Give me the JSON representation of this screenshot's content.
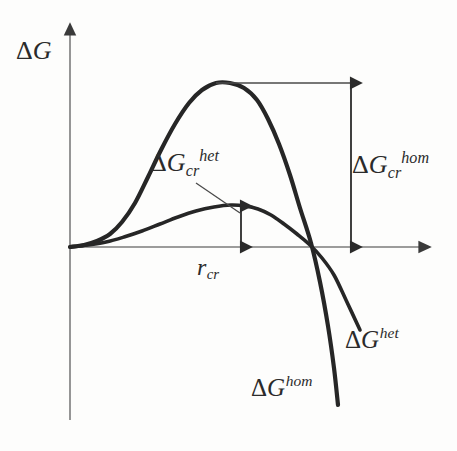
{
  "figure": {
    "background_color": "#fdfdfc",
    "ink_color": "#2b2b2b",
    "axis_color": "#6e6e6e",
    "curve_color": "#262626"
  },
  "axes": {
    "y_label": "ΔG",
    "x_label": "",
    "origin": {
      "x": 70,
      "y": 247
    },
    "y_axis_top": 28,
    "y_axis_bottom": 420,
    "x_axis_right": 428
  },
  "labels": {
    "delta_g_cr_het": {
      "base": "ΔG",
      "sub": "cr",
      "sup": "het"
    },
    "delta_g_cr_hom": {
      "base": "ΔG",
      "sub": "cr",
      "sup": "hom"
    },
    "r_cr": {
      "base": "r",
      "sub": "cr",
      "sup": ""
    },
    "delta_g_het": {
      "base": "ΔG",
      "sub": "",
      "sup": "het"
    },
    "delta_g_hom": {
      "base": "ΔG",
      "sub": "",
      "sup": "hom"
    }
  },
  "chart_data": {
    "type": "line",
    "title": "",
    "xlabel": "r",
    "ylabel": "ΔG",
    "grid": false,
    "legend": "none",
    "annotations": [
      {
        "name": "delta-g-cr-hom",
        "text": "ΔG_cr^hom",
        "kind": "double-arrow-vertical",
        "meaning": "critical free energy barrier for homogeneous nucleation",
        "from": {
          "x": 351,
          "y": 83
        },
        "to": {
          "x": 351,
          "y": 247
        }
      },
      {
        "name": "delta-g-cr-het",
        "text": "ΔG_cr^het",
        "kind": "double-arrow-vertical",
        "meaning": "critical free energy barrier for heterogeneous nucleation",
        "from": {
          "x": 241,
          "y": 206
        },
        "to": {
          "x": 241,
          "y": 247
        }
      },
      {
        "name": "r-cr",
        "text": "r_cr",
        "kind": "axis-tick",
        "meaning": "critical nucleus radius",
        "at": {
          "x": 241,
          "y": 247
        }
      },
      {
        "name": "peak-level-line",
        "kind": "horizontal-leader",
        "from": {
          "x": 216,
          "y": 83
        },
        "to": {
          "x": 357,
          "y": 83
        }
      },
      {
        "name": "het-callout-leader",
        "kind": "pointer-line",
        "from": {
          "x": 196,
          "y": 183
        },
        "to": {
          "x": 240,
          "y": 213
        }
      }
    ],
    "series": [
      {
        "name": "ΔG^hom",
        "label": "ΔG^hom",
        "description": "homogeneous nucleation free energy: rises to a high maximum then falls steeply negative",
        "peak": {
          "x": 218,
          "y": 83
        },
        "zero_crossing": {
          "x": 313,
          "y": 247
        },
        "end": {
          "x": 338,
          "y": 405
        },
        "points": [
          [
            70,
            247
          ],
          [
            84,
            245
          ],
          [
            97,
            241
          ],
          [
            110,
            234
          ],
          [
            122,
            222
          ],
          [
            135,
            203
          ],
          [
            148,
            177
          ],
          [
            161,
            150
          ],
          [
            175,
            124
          ],
          [
            189,
            103
          ],
          [
            202,
            90
          ],
          [
            216,
            83
          ],
          [
            230,
            83
          ],
          [
            244,
            88
          ],
          [
            257,
            100
          ],
          [
            268,
            119
          ],
          [
            279,
            144
          ],
          [
            290,
            175
          ],
          [
            300,
            208
          ],
          [
            311,
            243
          ],
          [
            320,
            282
          ],
          [
            328,
            326
          ],
          [
            334,
            368
          ],
          [
            338,
            405
          ]
        ]
      },
      {
        "name": "ΔG^het",
        "label": "ΔG^het",
        "description": "heterogeneous nucleation free energy: much lower maximum, shallower decline",
        "peak": {
          "x": 245,
          "y": 206
        },
        "zero_crossing": {
          "x": 314,
          "y": 247
        },
        "end": {
          "x": 360,
          "y": 330
        },
        "points": [
          [
            70,
            247
          ],
          [
            88,
            245
          ],
          [
            106,
            242
          ],
          [
            124,
            237
          ],
          [
            142,
            231
          ],
          [
            160,
            224
          ],
          [
            178,
            217
          ],
          [
            196,
            211
          ],
          [
            214,
            207
          ],
          [
            231,
            205
          ],
          [
            245,
            206
          ],
          [
            258,
            209
          ],
          [
            271,
            215
          ],
          [
            284,
            224
          ],
          [
            297,
            234
          ],
          [
            310,
            245
          ],
          [
            322,
            258
          ],
          [
            334,
            275
          ],
          [
            346,
            300
          ],
          [
            360,
            330
          ]
        ]
      }
    ]
  }
}
